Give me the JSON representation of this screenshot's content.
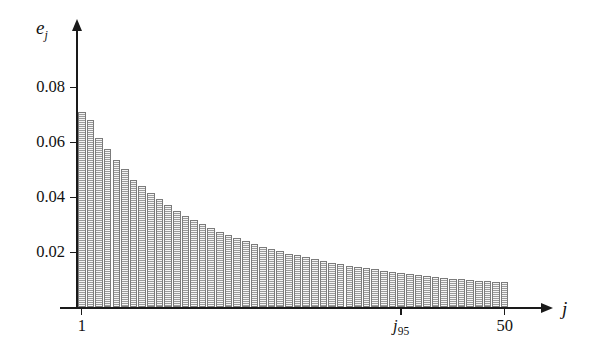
{
  "chart_data": {
    "type": "bar",
    "title": "",
    "subtitle": "",
    "xlabel": "j",
    "ylabel": "e_j",
    "ylabel_display": "e",
    "ylabel_sub": "j",
    "xlim": [
      0.5,
      50.5
    ],
    "ylim": [
      0,
      0.09
    ],
    "grid": false,
    "legend": null,
    "y_ticks": [
      0.02,
      0.04,
      0.06,
      0.08
    ],
    "y_tick_labels": [
      "0.02",
      "0.04",
      "0.06",
      "0.08"
    ],
    "x_ticks": [
      1,
      38,
      50
    ],
    "x_tick_labels": [
      "1",
      "j95",
      "50"
    ],
    "annotations": [
      {
        "name": "j95-marker",
        "text": "j",
        "sub": "95",
        "x": 38
      }
    ],
    "categories": [
      1,
      2,
      3,
      4,
      5,
      6,
      7,
      8,
      9,
      10,
      11,
      12,
      13,
      14,
      15,
      16,
      17,
      18,
      19,
      20,
      21,
      22,
      23,
      24,
      25,
      26,
      27,
      28,
      29,
      30,
      31,
      32,
      33,
      34,
      35,
      36,
      37,
      38,
      39,
      40,
      41,
      42,
      43,
      44,
      45,
      46,
      47,
      48,
      49,
      50
    ],
    "values": [
      0.0709,
      0.068,
      0.0615,
      0.0575,
      0.0535,
      0.0502,
      0.0465,
      0.044,
      0.0415,
      0.0393,
      0.0371,
      0.0351,
      0.0333,
      0.0317,
      0.0302,
      0.0288,
      0.0275,
      0.0263,
      0.0251,
      0.024,
      0.023,
      0.0221,
      0.0212,
      0.0204,
      0.0196,
      0.0189,
      0.0182,
      0.0175,
      0.0169,
      0.0163,
      0.0157,
      0.0152,
      0.0147,
      0.0142,
      0.0138,
      0.0133,
      0.0129,
      0.0125,
      0.0122,
      0.0118,
      0.0115,
      0.0111,
      0.0108,
      0.0105,
      0.0103,
      0.01,
      0.0097,
      0.0095,
      0.0093,
      0.0091
    ]
  },
  "style": {
    "bar_fill": "#bfbfbf",
    "bar_border": "#7b7b7b",
    "axis_color": "#1a1a1a",
    "text_color": "#111111",
    "background": "#ffffff"
  }
}
